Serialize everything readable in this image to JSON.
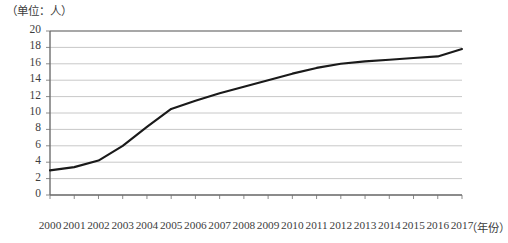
{
  "chart_data": {
    "type": "line",
    "title": "",
    "subtitle": "",
    "unit_note": "（单位：人）",
    "xlabel": "（年份）",
    "ylabel": "",
    "categories": [
      "2000",
      "2001",
      "2002",
      "2003",
      "2004",
      "2005",
      "2006",
      "2007",
      "2008",
      "2009",
      "2010",
      "2011",
      "2012",
      "2013",
      "2014",
      "2015",
      "2016",
      "2017"
    ],
    "x": [
      2000,
      2001,
      2002,
      2003,
      2004,
      2005,
      2006,
      2007,
      2008,
      2009,
      2010,
      2011,
      2012,
      2013,
      2014,
      2015,
      2016,
      2017
    ],
    "values": [
      3.0,
      3.4,
      4.2,
      6.0,
      8.3,
      10.5,
      11.5,
      12.4,
      13.2,
      14.0,
      14.8,
      15.5,
      16.0,
      16.3,
      16.5,
      16.7,
      16.9,
      17.8
    ],
    "series": [
      {
        "name": "",
        "values": [
          3.0,
          3.4,
          4.2,
          6.0,
          8.3,
          10.5,
          11.5,
          12.4,
          13.2,
          14.0,
          14.8,
          15.5,
          16.0,
          16.3,
          16.5,
          16.7,
          16.9,
          17.8
        ]
      }
    ],
    "ylim": [
      0,
      20
    ],
    "yticks": [
      0,
      2,
      4,
      6,
      8,
      10,
      12,
      14,
      16,
      18,
      20
    ],
    "ytick_labels": [
      "0",
      "2",
      "4",
      "6",
      "8",
      "10",
      "12",
      "14",
      "16",
      "18",
      "20"
    ],
    "grid": true,
    "grid_axis": "y",
    "legend": false,
    "legend_position": "none",
    "line_color": "#1a1a1a",
    "grid_color": "#c8c8c8",
    "axis_color": "#808080",
    "background_color": "#ffffff"
  }
}
